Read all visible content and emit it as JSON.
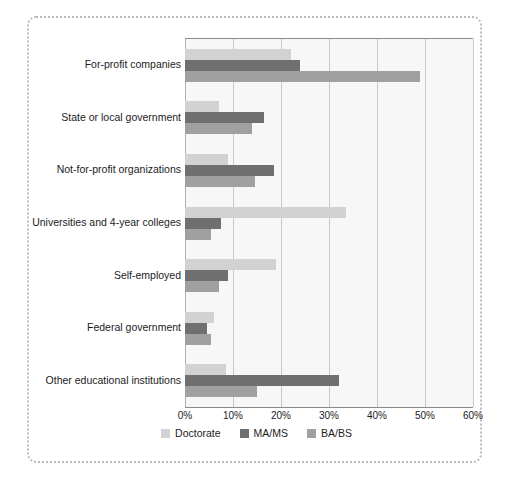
{
  "chart_data": {
    "type": "bar",
    "orientation": "horizontal",
    "title": "",
    "xlabel": "",
    "ylabel": "",
    "xlim": [
      0,
      60
    ],
    "xtick_labels": [
      "0%",
      "10%",
      "20%",
      "30%",
      "40%",
      "50%",
      "60%"
    ],
    "xtick_values": [
      0,
      10,
      20,
      30,
      40,
      50,
      60
    ],
    "grid": true,
    "legend_position": "bottom-center",
    "categories": [
      "For-profit companies",
      "State or local government",
      "Not-for-profit organizations",
      "Universities and 4-year colleges",
      "Self-employed",
      "Federal government",
      "Other educational institutions"
    ],
    "series": [
      {
        "name": "Doctorate",
        "color": "#d2d2d2",
        "values": [
          22,
          7,
          9,
          33.5,
          19,
          6,
          8.5
        ]
      },
      {
        "name": "MA/MS",
        "color": "#6f6f6f",
        "values": [
          24,
          16.5,
          18.5,
          7.5,
          9,
          4.5,
          32
        ]
      },
      {
        "name": "BA/BS",
        "color": "#a0a0a0",
        "values": [
          49,
          14,
          14.5,
          5.5,
          7,
          5.5,
          15
        ]
      }
    ]
  },
  "legend": {
    "items": [
      {
        "label": "Doctorate",
        "color": "#d2d2d2"
      },
      {
        "label": "MA/MS",
        "color": "#6f6f6f"
      },
      {
        "label": "BA/BS",
        "color": "#a0a0a0"
      }
    ]
  }
}
